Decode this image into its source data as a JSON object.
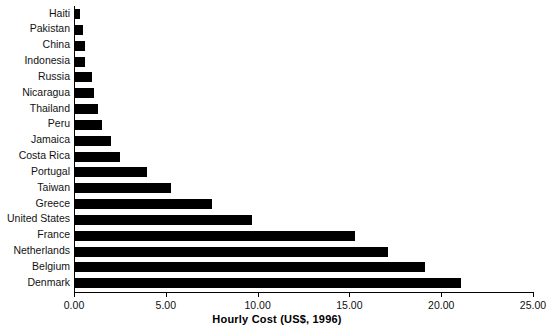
{
  "chart_data": {
    "type": "bar",
    "orientation": "horizontal",
    "title": "",
    "xlabel": "Hourly Cost (US$, 1996)",
    "ylabel": "",
    "xlim": [
      0,
      25
    ],
    "xticks": [
      "0.00",
      "5.00",
      "10.00",
      "15.00",
      "20.00",
      "25.00"
    ],
    "xtick_values": [
      0,
      5,
      10,
      15,
      20,
      25
    ],
    "grid": false,
    "legend": null,
    "bar_color": "#000000",
    "axis_color": "#000000",
    "categories": [
      "Haiti",
      "Pakistan",
      "China",
      "Indonesia",
      "Russia",
      "Nicaragua",
      "Thailand",
      "Peru",
      "Jamaica",
      "Costa Rica",
      "Portugal",
      "Taiwan",
      "Greece",
      "United States",
      "France",
      "Netherlands",
      "Belgium",
      "Denmark"
    ],
    "values": [
      0.3,
      0.5,
      0.6,
      0.6,
      1.0,
      1.1,
      1.3,
      1.5,
      2.0,
      2.5,
      4.0,
      5.3,
      7.5,
      9.7,
      15.3,
      17.1,
      19.1,
      21.1
    ]
  }
}
